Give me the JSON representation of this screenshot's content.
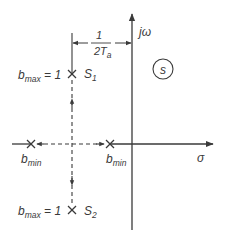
{
  "diagram": {
    "type": "s-plane pole diagram",
    "plane_label": "s",
    "axes": {
      "imag_label": "jω",
      "real_label": "σ"
    },
    "dimension": {
      "numerator": "1",
      "denominator_main": "2T",
      "denominator_sub": "a"
    },
    "points": [
      {
        "id": "S1",
        "name": "S",
        "sub": "1",
        "label_main": "b",
        "label_sub": "max",
        "label_eq": " = 1"
      },
      {
        "id": "S2",
        "name": "S",
        "sub": "2",
        "label_main": "b",
        "label_sub": "max",
        "label_eq": " = 1"
      },
      {
        "id": "bmin_left",
        "label_main": "b",
        "label_sub": "min"
      },
      {
        "id": "bmin_right",
        "label_main": "b",
        "label_sub": "min"
      }
    ],
    "colors": {
      "line": "#3a3a3a",
      "background": "#ffffff"
    }
  }
}
